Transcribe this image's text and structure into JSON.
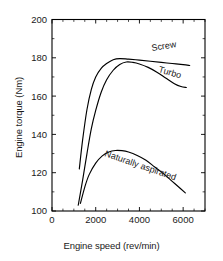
{
  "chart_data": {
    "type": "line",
    "title": "",
    "xlabel": "Engine speed (rev/min)",
    "ylabel": "Engine torque (Nm)",
    "xlim": [
      0,
      7000
    ],
    "ylim": [
      100,
      200
    ],
    "grid": false,
    "legend_position": "inline-curve-labels",
    "x_major_ticks": [
      0,
      2000,
      4000,
      6000
    ],
    "x_major_tick_labels": [
      "0",
      "2000",
      "4000",
      "6000"
    ],
    "x_minor_tick_interval": 500,
    "y_major_ticks": [
      100,
      120,
      140,
      160,
      180,
      200
    ],
    "y_major_tick_labels": [
      "100",
      "120",
      "140",
      "160",
      "180",
      "200"
    ],
    "y_minor_tick_interval": 10,
    "series": [
      {
        "name": "Screw",
        "label": "Screw",
        "color": "#000000",
        "points": [
          [
            1250,
            122.0
          ],
          [
            1400,
            137.0
          ],
          [
            1600,
            153.0
          ],
          [
            1800,
            163.5
          ],
          [
            2000,
            170.0
          ],
          [
            2250,
            174.5
          ],
          [
            2500,
            177.0
          ],
          [
            2800,
            179.0
          ],
          [
            3100,
            179.6
          ],
          [
            3500,
            179.3
          ],
          [
            4000,
            178.8
          ],
          [
            4500,
            178.2
          ],
          [
            5000,
            177.6
          ],
          [
            5500,
            177.0
          ],
          [
            6000,
            176.4
          ],
          [
            6300,
            176.0
          ]
        ]
      },
      {
        "name": "Turbo",
        "label": "Turbo",
        "color": "#000000",
        "points": [
          [
            1200,
            103.0
          ],
          [
            1400,
            116.0
          ],
          [
            1600,
            130.0
          ],
          [
            1800,
            143.0
          ],
          [
            2000,
            152.5
          ],
          [
            2250,
            162.0
          ],
          [
            2500,
            168.5
          ],
          [
            2800,
            173.5
          ],
          [
            3100,
            176.5
          ],
          [
            3400,
            177.8
          ],
          [
            3700,
            177.6
          ],
          [
            4000,
            176.8
          ],
          [
            4400,
            175.0
          ],
          [
            4800,
            172.5
          ],
          [
            5200,
            169.5
          ],
          [
            5600,
            166.5
          ],
          [
            5900,
            165.0
          ],
          [
            6150,
            164.5
          ]
        ]
      },
      {
        "name": "Naturally aspirated",
        "label": "Naturally aspirated",
        "color": "#000000",
        "points": [
          [
            1300,
            104.0
          ],
          [
            1500,
            112.5
          ],
          [
            1700,
            119.0
          ],
          [
            2000,
            125.0
          ],
          [
            2300,
            128.8
          ],
          [
            2600,
            130.8
          ],
          [
            2900,
            131.6
          ],
          [
            3200,
            131.5
          ],
          [
            3500,
            130.8
          ],
          [
            3900,
            129.0
          ],
          [
            4300,
            126.5
          ],
          [
            4700,
            123.0
          ],
          [
            5100,
            119.5
          ],
          [
            5500,
            115.5
          ],
          [
            5900,
            111.5
          ],
          [
            6100,
            109.5
          ]
        ]
      }
    ]
  }
}
